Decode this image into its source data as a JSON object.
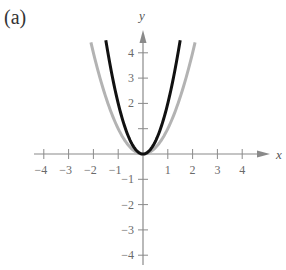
{
  "panel_label": "(a)",
  "chart_data": {
    "type": "line",
    "title": "",
    "panel_label": "(a)",
    "xlabel": "x",
    "ylabel": "y",
    "xlim": [
      -4.5,
      4.6
    ],
    "ylim": [
      -4.6,
      4.6
    ],
    "grid": false,
    "legend": null,
    "x_ticks": [
      -4,
      -3,
      -2,
      -1,
      1,
      2,
      3,
      4
    ],
    "x_tick_labels": [
      "−4",
      "−3",
      "−2",
      "−1",
      "1",
      "2",
      "3",
      "4"
    ],
    "y_ticks": [
      4,
      3,
      2,
      1,
      -1,
      -2,
      -3,
      -4
    ],
    "y_tick_labels": [
      "4",
      "3",
      "2",
      "",
      "−1",
      "−2",
      "−3",
      "−4"
    ],
    "series": [
      {
        "name": "y = x^2",
        "color": "#b3b3b3",
        "function": "x^2",
        "x": [
          -2.1,
          -1.5,
          -1,
          -0.5,
          0,
          0.5,
          1,
          1.5,
          2.1
        ],
        "values": [
          4.41,
          2.25,
          1,
          0.25,
          0,
          0.25,
          1,
          2.25,
          4.41
        ]
      },
      {
        "name": "y = 2x^2",
        "color": "#111111",
        "function": "2x^2",
        "x": [
          -1.5,
          -1,
          -0.5,
          0,
          0.5,
          1,
          1.5
        ],
        "values": [
          4.5,
          2,
          0.5,
          0,
          0.5,
          2,
          4.5
        ]
      }
    ]
  }
}
